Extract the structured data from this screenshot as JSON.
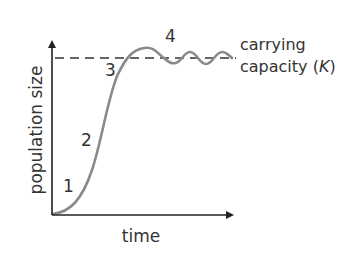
{
  "diagram": {
    "y_axis_label": "population size",
    "x_axis_label": "time",
    "carrying_capacity_label_line1": "carrying",
    "carrying_capacity_label_line2_prefix": "capacity (",
    "carrying_capacity_symbol": "K",
    "carrying_capacity_label_line2_suffix": ")",
    "phase_labels": [
      "1",
      "2",
      "3",
      "4"
    ],
    "colors": {
      "curve": "#8a8a8a",
      "axes": "#222222",
      "dashed_line": "#333333",
      "text": "#333333"
    }
  }
}
